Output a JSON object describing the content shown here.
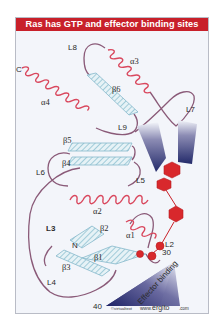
{
  "figure": {
    "title": "Ras has GTP and effector binding sites",
    "credit_small": "©virtualtext",
    "credit_url_prefix": "www.",
    "credit_url_main": "ergito",
    "credit_url_suffix": ".com",
    "colors": {
      "header": "#c8202a",
      "helix": "#d9485e",
      "loop": "#8a5a78",
      "strand": "#9ccbd8",
      "gtp": "#d8282c",
      "effector": "#2a2f6e",
      "background": "#f3f5fa"
    }
  },
  "labels": {
    "C": "C",
    "N": "N",
    "L2": "L2",
    "L3": "L3",
    "L4": "L4",
    "L5": "L5",
    "L6": "L6",
    "L7": "L7",
    "L8": "L8",
    "L9": "L9",
    "a1": "α1",
    "a2": "α2",
    "a3": "α3",
    "a4": "α4",
    "b1": "β1",
    "b2": "β2",
    "b3": "β3",
    "b4": "β4",
    "b5": "β5",
    "b6": "β6",
    "res30": "30",
    "res40": "40",
    "effector": "Effector binding"
  }
}
